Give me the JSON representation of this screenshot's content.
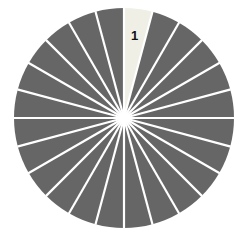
{
  "chart_data": {
    "type": "pie",
    "title": "",
    "subtitle": "",
    "xlabel": "",
    "ylabel": "",
    "legend": [],
    "annotations": [
      "1"
    ],
    "categories": [
      "1",
      "2",
      "3",
      "4",
      "5",
      "6",
      "7",
      "8",
      "9",
      "10",
      "11",
      "12",
      "13",
      "14",
      "15",
      "16",
      "17",
      "18",
      "19",
      "20",
      "21",
      "22",
      "23",
      "24"
    ],
    "values": [
      1,
      1,
      1,
      1,
      1,
      1,
      1,
      1,
      1,
      1,
      1,
      1,
      1,
      1,
      1,
      1,
      1,
      1,
      1,
      1,
      1,
      1,
      1,
      1
    ],
    "slice_count": 24,
    "slice_angle_degrees": 15,
    "start_angle_degrees": 0,
    "highlighted_slice_index": 0,
    "highlighted_slice_label": "1",
    "labels_shown": [
      "1"
    ],
    "colors": {
      "slice_default": "#666666",
      "slice_highlight": "#efefe6",
      "divider": "#ffffff",
      "background": "#ffffff",
      "label_text": "#121212"
    },
    "geometry": {
      "center_x": 124,
      "center_y": 118,
      "radius": 110,
      "divider_width": 2.2,
      "label_radius": 82
    }
  },
  "figure": {
    "width": 249,
    "height": 235,
    "alt": "Pie chart with 24 equal wedges, one wedge highlighted and labeled 1"
  }
}
